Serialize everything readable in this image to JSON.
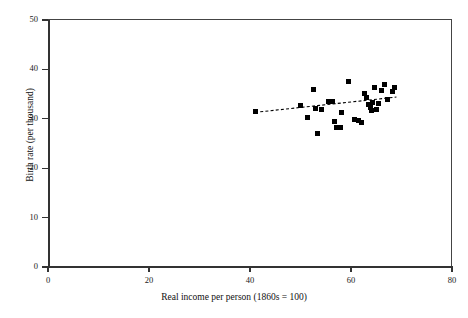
{
  "chart_data": {
    "type": "scatter",
    "title": "",
    "xlabel": "Real income per person (1860s = 100)",
    "ylabel": "Birth rate (per thousand)",
    "xlim": [
      0,
      80
    ],
    "ylim": [
      0,
      50
    ],
    "xticks": [
      0,
      20,
      40,
      60,
      80
    ],
    "yticks": [
      0,
      10,
      20,
      30,
      40,
      50
    ],
    "xtick_labels": [
      "0",
      "20",
      "40",
      "60",
      "80"
    ],
    "ytick_labels": [
      "0",
      "10",
      "20",
      "30",
      "40",
      "50"
    ],
    "grid": false,
    "legend": "none",
    "marker_style": "filled-square",
    "marker_color": "#000000",
    "points": [
      {
        "x": 41.0,
        "y": 31.4
      },
      {
        "x": 50.0,
        "y": 32.6
      },
      {
        "x": 51.4,
        "y": 30.2
      },
      {
        "x": 52.6,
        "y": 36.0
      },
      {
        "x": 53.0,
        "y": 32.1
      },
      {
        "x": 53.4,
        "y": 27.0
      },
      {
        "x": 54.2,
        "y": 31.8
      },
      {
        "x": 55.6,
        "y": 33.6
      },
      {
        "x": 56.4,
        "y": 33.5
      },
      {
        "x": 56.8,
        "y": 29.4
      },
      {
        "x": 57.2,
        "y": 28.3
      },
      {
        "x": 57.9,
        "y": 28.2
      },
      {
        "x": 58.2,
        "y": 31.2
      },
      {
        "x": 59.6,
        "y": 37.6
      },
      {
        "x": 60.6,
        "y": 29.8
      },
      {
        "x": 61.4,
        "y": 29.6
      },
      {
        "x": 62.0,
        "y": 29.3
      },
      {
        "x": 62.6,
        "y": 35.1
      },
      {
        "x": 63.0,
        "y": 34.4
      },
      {
        "x": 63.4,
        "y": 32.9
      },
      {
        "x": 63.8,
        "y": 32.2
      },
      {
        "x": 64.0,
        "y": 31.6
      },
      {
        "x": 64.2,
        "y": 33.4
      },
      {
        "x": 64.6,
        "y": 36.3
      },
      {
        "x": 65.0,
        "y": 31.9
      },
      {
        "x": 65.4,
        "y": 33.0
      },
      {
        "x": 66.0,
        "y": 35.8
      },
      {
        "x": 66.6,
        "y": 37.0
      },
      {
        "x": 67.2,
        "y": 34.0
      },
      {
        "x": 68.2,
        "y": 35.6
      },
      {
        "x": 68.6,
        "y": 36.4
      }
    ],
    "trend_line": {
      "style": "dashed",
      "color": "#000000",
      "x_start": 41.0,
      "y_start": 31.3,
      "x_end": 69.0,
      "y_end": 34.4
    }
  }
}
